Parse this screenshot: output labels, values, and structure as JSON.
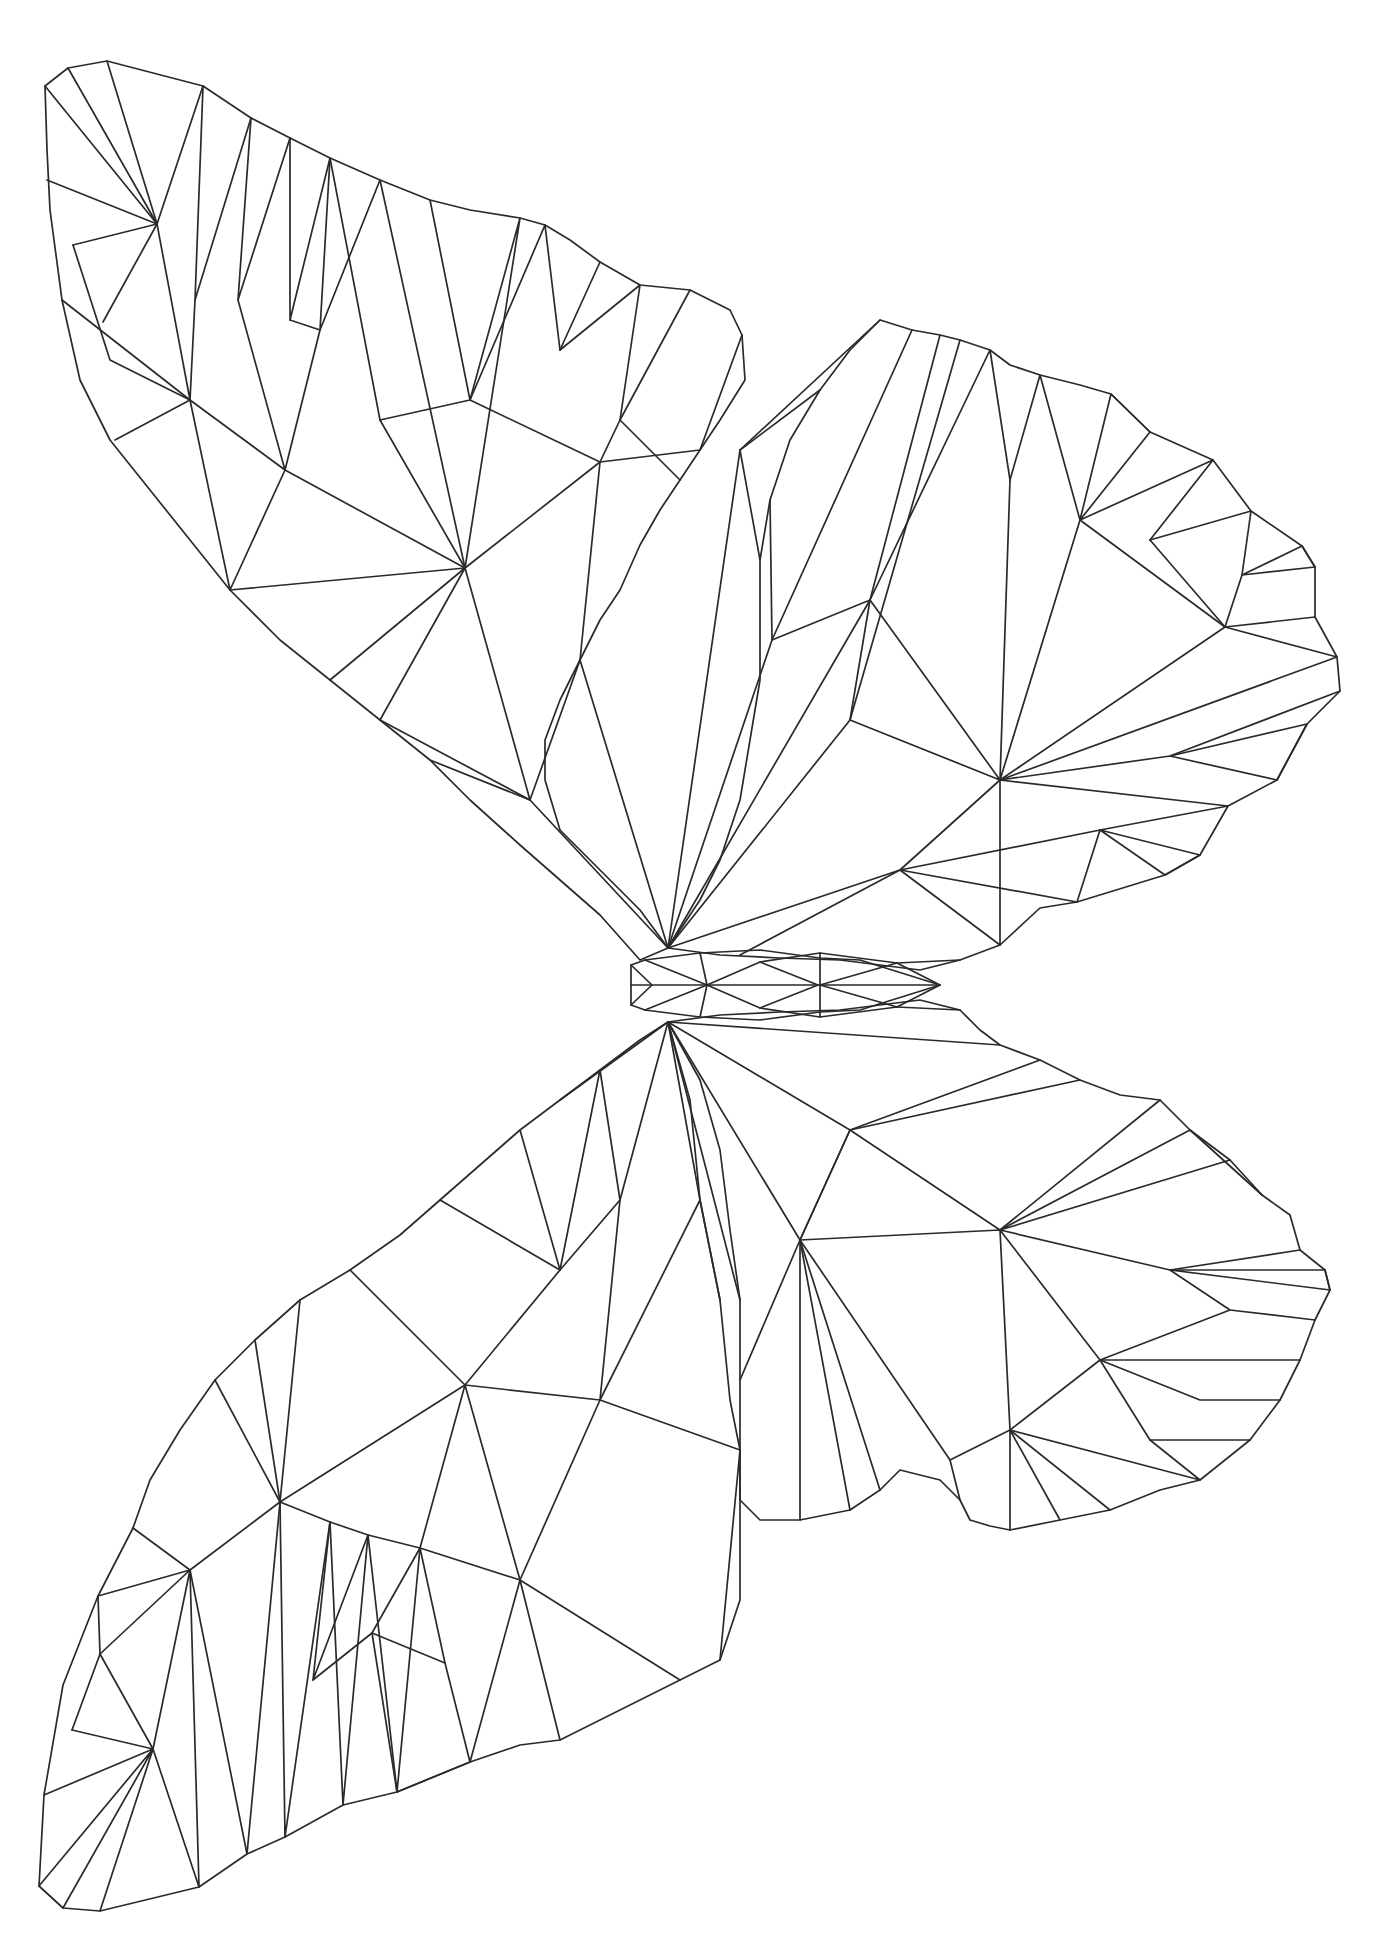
{
  "image": {
    "subject": "low-poly butterfly line drawing",
    "stroke_color": "#2a2a2a",
    "background_color": "#ffffff"
  },
  "parts": {
    "upper_left_wing": "upper-left-wing",
    "upper_right_wing": "upper-right-wing",
    "lower_left_wing": "lower-left-wing",
    "lower_right_wing": "lower-right-wing",
    "body": "body"
  }
}
